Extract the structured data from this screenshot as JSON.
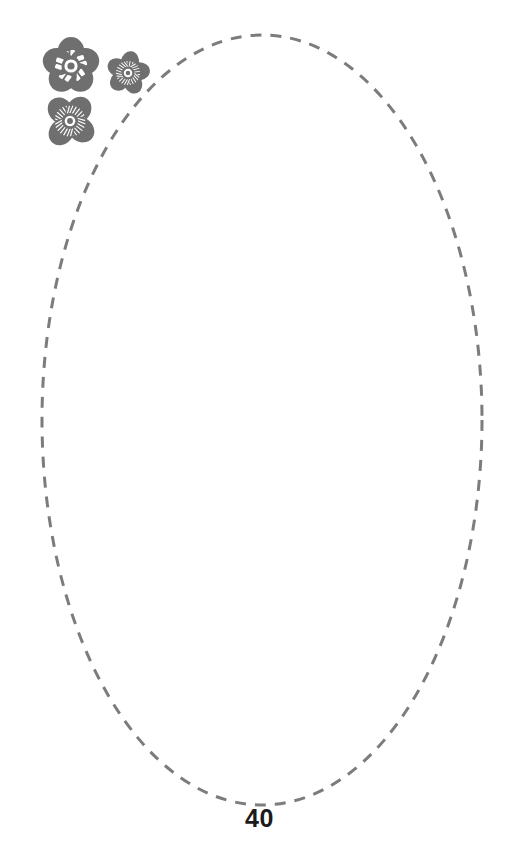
{
  "page": {
    "number": "40",
    "background_color": "#ffffff",
    "width": 519,
    "height": 862
  },
  "writing_area": {
    "shape_name": "dashed-ellipse",
    "label": "",
    "stroke_color": "#7c7c7c",
    "fill_color": "none",
    "stroke_width": 3,
    "dash_length": 11,
    "dash_gap": 9,
    "center_x": 262,
    "center_y": 420,
    "radius_x": 220,
    "radius_y": 385
  },
  "decoration": {
    "name": "flower-cluster",
    "color": "#6f6f6f",
    "flower_count": 3,
    "flowers": [
      {
        "name": "flower-large-blocky",
        "petals": 5,
        "pattern": "blocks",
        "center_x": 37,
        "center_y": 33,
        "size": 62
      },
      {
        "name": "flower-small-striped",
        "petals": 5,
        "pattern": "radial-lines",
        "center_x": 94,
        "center_y": 40,
        "size": 45
      },
      {
        "name": "flower-medium-fan",
        "petals": 4,
        "pattern": "radial-lines",
        "center_x": 36,
        "center_y": 88,
        "size": 55
      }
    ]
  }
}
